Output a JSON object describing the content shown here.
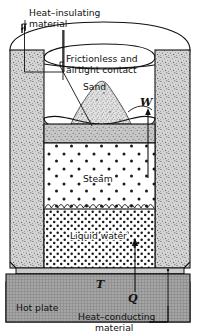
{
  "figure": {
    "labels": {
      "heat_insulating": "Heat–insulating",
      "heat_insulating_2": "material",
      "frictionless": "Frictionless and",
      "frictionless_2": "airtight contact",
      "sand": "Sand",
      "steam": "Steam",
      "liquid_water": "Liquid water",
      "hot_plate": "Hot plate",
      "heat_conducting": "Heat–conducting",
      "heat_conducting_2": "material",
      "work": "W",
      "temperature": "T",
      "heat": "Q"
    },
    "colors": {
      "stroke": "#111111",
      "insulation_fill": "#cfcfcf",
      "piston_fill": "#b8b8b8",
      "hot_plate_fill": "#9a9a9a",
      "sand_fill": "#d8d8d8",
      "background": "#ffffff"
    },
    "regions": [
      {
        "name": "heat-insulating-wall-left",
        "fill": "speckled-gray"
      },
      {
        "name": "heat-insulating-wall-right",
        "fill": "speckled-gray"
      },
      {
        "name": "piston-block",
        "fill": "speckled-gray"
      },
      {
        "name": "sand-pile",
        "fill": "stippled"
      },
      {
        "name": "steam-chamber",
        "fill": "sparse-dots"
      },
      {
        "name": "liquid-water-chamber",
        "fill": "dense-dots"
      },
      {
        "name": "hot-plate",
        "fill": "cross-hatch-gray"
      }
    ]
  }
}
